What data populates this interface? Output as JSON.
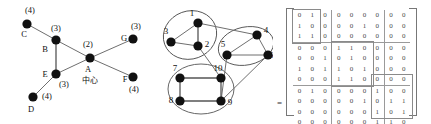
{
  "figure": {
    "title": "",
    "panels": [
      "community-graph-labeled",
      "community-graph-numbered",
      "adjacency-block-matrix"
    ]
  },
  "left_graph": {
    "caption": "",
    "center_annotation": "中心",
    "nodes": [
      {
        "id": "A",
        "label": "A",
        "degree_label": "(2)",
        "x": 90,
        "y": 58
      },
      {
        "id": "B",
        "label": "B",
        "degree_label": "(3)",
        "x": 56,
        "y": 40
      },
      {
        "id": "C",
        "label": "C",
        "degree_label": "(4)",
        "x": 27,
        "y": 24
      },
      {
        "id": "D",
        "label": "D",
        "degree_label": "(4)",
        "x": 33,
        "y": 97
      },
      {
        "id": "E",
        "label": "E",
        "degree_label": "(3)",
        "x": 56,
        "y": 74
      },
      {
        "id": "F",
        "label": "F",
        "degree_label": "(4)",
        "x": 133,
        "y": 77
      },
      {
        "id": "G",
        "label": "G",
        "degree_label": "(3)",
        "x": 133,
        "y": 39
      }
    ],
    "edges": [
      {
        "from": "C",
        "to": "B"
      },
      {
        "from": "B",
        "to": "E"
      },
      {
        "from": "B",
        "to": "A"
      },
      {
        "from": "E",
        "to": "A"
      },
      {
        "from": "E",
        "to": "D"
      },
      {
        "from": "A",
        "to": "G"
      },
      {
        "from": "A",
        "to": "F"
      }
    ]
  },
  "middle_graph": {
    "caption": "",
    "clusters": [
      {
        "name": "cluster-1",
        "members": [
          1,
          2,
          3
        ],
        "cx": 45,
        "cy": 35,
        "rx": 27,
        "ry": 24,
        "rotation": -20
      },
      {
        "name": "cluster-2",
        "members": [
          4,
          5,
          6
        ],
        "cx": 101,
        "cy": 50,
        "rx": 27,
        "ry": 19,
        "rotation": -12
      },
      {
        "name": "cluster-3",
        "members": [
          7,
          8,
          9,
          10
        ],
        "cx": 56,
        "cy": 89,
        "rx": 32,
        "ry": 24,
        "rotation": 0
      }
    ],
    "nodes": [
      {
        "id": 1,
        "label": "1",
        "x": 53,
        "y": 23
      },
      {
        "id": 2,
        "label": "2",
        "x": 53,
        "y": 46
      },
      {
        "id": 3,
        "label": "3",
        "x": 26,
        "y": 42
      },
      {
        "id": 4,
        "label": "4",
        "x": 112,
        "y": 35
      },
      {
        "id": 5,
        "label": "5",
        "x": 82,
        "y": 55
      },
      {
        "id": 6,
        "label": "6",
        "x": 123,
        "y": 55
      },
      {
        "id": 7,
        "label": "7",
        "x": 35,
        "y": 78
      },
      {
        "id": 8,
        "label": "8",
        "x": 35,
        "y": 101
      },
      {
        "id": 9,
        "label": "9",
        "x": 76,
        "y": 101
      },
      {
        "id": 10,
        "label": "10",
        "x": 76,
        "y": 78
      }
    ],
    "intra_edges": [
      {
        "from": 1,
        "to": 2
      },
      {
        "from": 1,
        "to": 3
      },
      {
        "from": 2,
        "to": 3
      },
      {
        "from": 4,
        "to": 5
      },
      {
        "from": 4,
        "to": 6
      },
      {
        "from": 5,
        "to": 6
      },
      {
        "from": 7,
        "to": 8
      },
      {
        "from": 7,
        "to": 10
      },
      {
        "from": 8,
        "to": 9
      },
      {
        "from": 9,
        "to": 10
      }
    ],
    "inter_edges": [
      {
        "from": 1,
        "to": 4
      },
      {
        "from": 2,
        "to": 10
      },
      {
        "from": 9,
        "to": 5
      },
      {
        "from": 9,
        "to": 6
      }
    ]
  },
  "matrix": {
    "equals_sign": "=",
    "size": 10,
    "block_boundaries": [
      3,
      7
    ],
    "rows": [
      [
        "0",
        "1",
        "1",
        "0",
        "0",
        "0",
        "0",
        "0",
        "0",
        "0"
      ],
      [
        "1",
        "0",
        "1",
        "0",
        "0",
        "0",
        "1",
        "0",
        "0",
        "0"
      ],
      [
        "1",
        "1",
        "0",
        "0",
        "0",
        "0",
        "0",
        "0",
        "0",
        "0"
      ],
      [
        "0",
        "0",
        "0",
        "0",
        "1",
        "1",
        "0",
        "0",
        "0",
        "0"
      ],
      [
        "0",
        "0",
        "0",
        "1",
        "0",
        "1",
        "0",
        "0",
        "0",
        "0"
      ],
      [
        "1",
        "0",
        "0",
        "1",
        "1",
        "0",
        "1",
        "0",
        "0",
        "0"
      ],
      [
        "0",
        "0",
        "0",
        "0",
        "1",
        "1",
        "0",
        "0",
        "0",
        "0"
      ],
      [
        "0",
        "1",
        "0",
        "0",
        "0",
        "0",
        "0",
        "1",
        "0",
        "0"
      ],
      [
        "0",
        "0",
        "0",
        "0",
        "0",
        "0",
        "1",
        "0",
        "1",
        "1"
      ],
      [
        "0",
        "0",
        "0",
        "0",
        "0",
        "0",
        "0",
        "1",
        "0",
        "1"
      ],
      [
        "0",
        "0",
        "0",
        "0",
        "0",
        "0",
        "0",
        "1",
        "1",
        "0"
      ]
    ],
    "display_rows": [
      [
        "0",
        "1",
        "0",
        "0",
        "0",
        "0",
        "0",
        "0",
        "0"
      ],
      [
        "1",
        "0",
        "0",
        "0",
        "0",
        "1",
        "0",
        "0",
        "0"
      ],
      [
        "1",
        "1",
        "0",
        "0",
        "0",
        "0",
        "0",
        "0",
        "0"
      ],
      [
        "0",
        "0",
        "0",
        "1",
        "1",
        "0",
        "0",
        "0",
        "0"
      ],
      [
        "0",
        "0",
        "1",
        "0",
        "1",
        "0",
        "0",
        "0",
        "0"
      ],
      [
        "1",
        "0",
        "1",
        "1",
        "0",
        "1",
        "0",
        "0",
        "0"
      ],
      [
        "0",
        "0",
        "0",
        "1",
        "1",
        "0",
        "0",
        "0",
        "0"
      ],
      [
        "0",
        "1",
        "0",
        "0",
        "0",
        "0",
        "1",
        "0",
        "0"
      ],
      [
        "0",
        "0",
        "0",
        "0",
        "0",
        "1",
        "0",
        "1",
        "1"
      ],
      [
        "0",
        "0",
        "0",
        "0",
        "0",
        "0",
        "1",
        "0",
        "1"
      ],
      [
        "0",
        "0",
        "0",
        "0",
        "0",
        "0",
        "1",
        "1",
        "0"
      ]
    ]
  }
}
